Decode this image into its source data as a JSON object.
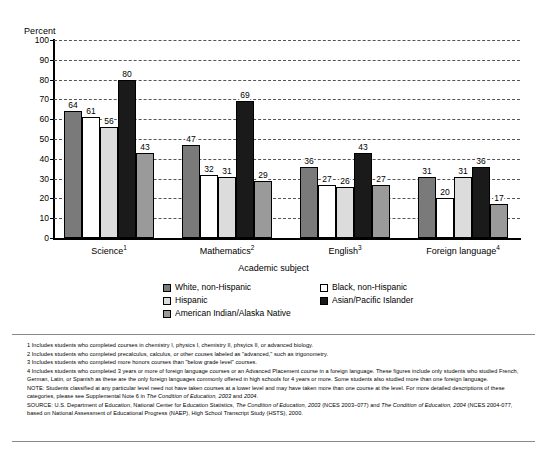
{
  "chart_data": {
    "type": "bar",
    "title": "",
    "ylabel": "Percent",
    "xlabel": "Academic subject",
    "ylim": [
      0,
      100
    ],
    "yticks": [
      0,
      10,
      20,
      30,
      40,
      50,
      60,
      70,
      80,
      90,
      100
    ],
    "grid": true,
    "legend_position": "below-axis",
    "categories": [
      "Science",
      "Mathematics",
      "English",
      "Foreign language"
    ],
    "category_footnotes": [
      "1",
      "2",
      "3",
      "4"
    ],
    "series": [
      {
        "name": "White, non-Hispanic",
        "swatch": "#7a7a7a",
        "values": [
          64,
          47,
          36,
          31
        ]
      },
      {
        "name": "Black, non-Hispanic",
        "swatch": "#ffffff",
        "values": [
          61,
          32,
          27,
          20
        ]
      },
      {
        "name": "Hispanic",
        "swatch": "#dcdcdc",
        "values": [
          56,
          31,
          26,
          31
        ]
      },
      {
        "name": "Asian/Pacific Islander",
        "swatch": "#1a1a1a",
        "values": [
          80,
          69,
          43,
          36
        ]
      },
      {
        "name": "American Indian/Alaska Native",
        "swatch": "#9a9a9a",
        "values": [
          43,
          29,
          27,
          17
        ]
      }
    ]
  },
  "legend": {
    "rows": [
      {
        "left": "White, non-Hispanic",
        "right": "Black, non-Hispanic"
      },
      {
        "left": "Hispanic",
        "right": "Asian/Pacific Islander"
      },
      {
        "left": "American Indian/Alaska Native",
        "right": ""
      }
    ]
  },
  "notes": {
    "footnote1": "1 Includes students who completed courses in chemistry I, physics I, chemistry II, phsyics II, or advanced biology.",
    "footnote2": "2 Includes students who completed precalculus, calculus, or other couses labeled as \"advanced,\" such as trigonometry.",
    "footnote3": "3 Includes students who completed more honors courses than \"below grade level\" courses.",
    "footnote4": "4 Includes students who completed 3 years or more of foreign language courses or an Advanced Placement course in a foreign language. These figures include only students who studied French, German, Latin, or Spanish as these are the only foreign languages commonly offered in high schools for 4 years or more. Some students also studied more than one foreign language.",
    "note_lead": "NOTE: Students classified at any particular level need not have taken courses at a lower level and may have taken more than one course at the level. For more detailed descriptions of these categories, please see Supplemental Note 6 in ",
    "note_italic1": "The Condition of Education, 2003",
    "note_mid1": " and ",
    "note_italic2": "2004",
    "note_tail": ".",
    "source_lead": "SOURCE: U.S. Department of Education, National Center for Education Statistics, ",
    "source_italic1": "The Condition of Education, 2003",
    "source_mid1": " (NCES 2003–077) and ",
    "source_italic2": "The Condition of Education, 2004",
    "source_tail": " (NCES 2004-077, based on National Assessment of Educational Progress (NAEP), High School Transcript Study (HSTS), 2000."
  }
}
